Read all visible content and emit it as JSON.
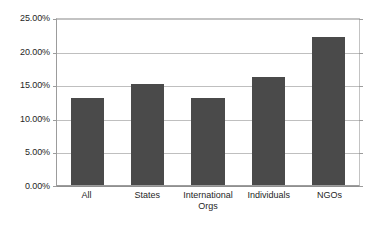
{
  "chart_data": {
    "type": "bar",
    "title": "",
    "subtitle": "",
    "xlabel": "",
    "ylabel": "",
    "categories": [
      "All",
      "States",
      "International Orgs",
      "Individuals",
      "NGOs"
    ],
    "values": [
      13,
      15,
      13,
      16,
      22
    ],
    "value_labels": [
      "13.00%",
      "15.00%",
      "13.00%",
      "16.00%",
      "22.00%"
    ],
    "ylim": [
      0,
      25
    ],
    "ytick_values": [
      0,
      5,
      10,
      15,
      20,
      25
    ],
    "ytick_labels": [
      "0.00%",
      "5.00%",
      "10.00%",
      "15.00%",
      "20.00%",
      "25.00%"
    ],
    "grid": true,
    "grid_axis": "y",
    "legend": false,
    "legend_position": "none",
    "orientation": "vertical",
    "series": [
      {
        "name": "",
        "values": [
          13,
          15,
          13,
          16,
          22
        ]
      }
    ],
    "colors": {
      "bar_fill": "#4a4a4a",
      "gridline": "#bfbfbf",
      "axis_line": "#9c9c9c",
      "plot_background": "#ffffff",
      "canvas_background": "#ffffff",
      "tick_label": "#262626"
    }
  }
}
